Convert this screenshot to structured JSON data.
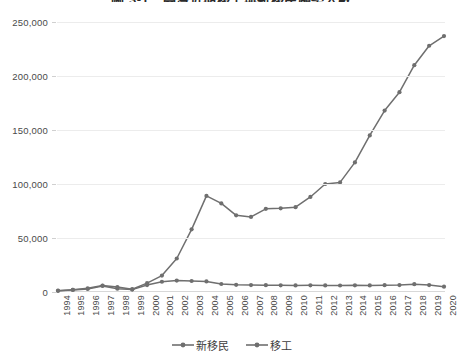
{
  "chart_data": {
    "type": "line",
    "title": "圖 3-1　臺灣近期移工與新移民趨勢人數",
    "xlabel": "",
    "ylabel": "",
    "grid": true,
    "legend_position": "bottom",
    "x": [
      "1994",
      "1995",
      "1996",
      "1997",
      "1998",
      "1999",
      "2000",
      "2001",
      "2002",
      "2003",
      "2004",
      "2005",
      "2006",
      "2007",
      "2008",
      "2009",
      "2010",
      "2011",
      "2012",
      "2013",
      "2014",
      "2015",
      "2016",
      "2017",
      "2018",
      "2019",
      "2020"
    ],
    "ylim": [
      0,
      250000
    ],
    "yticks": [
      0,
      50000,
      100000,
      150000,
      200000,
      250000
    ],
    "ytick_labels": [
      "0",
      "50,000",
      "100,000",
      "150,000",
      "200,000",
      "250,000"
    ],
    "series": [
      {
        "name": "新移民",
        "color": "#6f6f6f",
        "values": [
          1200,
          1900,
          2800,
          5600,
          3000,
          2200,
          6400,
          9500,
          10600,
          10200,
          9800,
          7400,
          6600,
          6400,
          6300,
          6200,
          6100,
          6200,
          6100,
          6000,
          6200,
          6100,
          6300,
          6400,
          7200,
          6400,
          4900
        ]
      },
      {
        "name": "移工",
        "color": "#6f6f6f",
        "values": [
          1100,
          2100,
          3400,
          6000,
          4600,
          2600,
          8200,
          15200,
          31000,
          58000,
          89000,
          82000,
          71000,
          69500,
          77000,
          77500,
          78500,
          88000,
          100000,
          101500,
          120000,
          145000,
          168000,
          185000,
          210000,
          228000,
          237000
        ]
      }
    ]
  }
}
